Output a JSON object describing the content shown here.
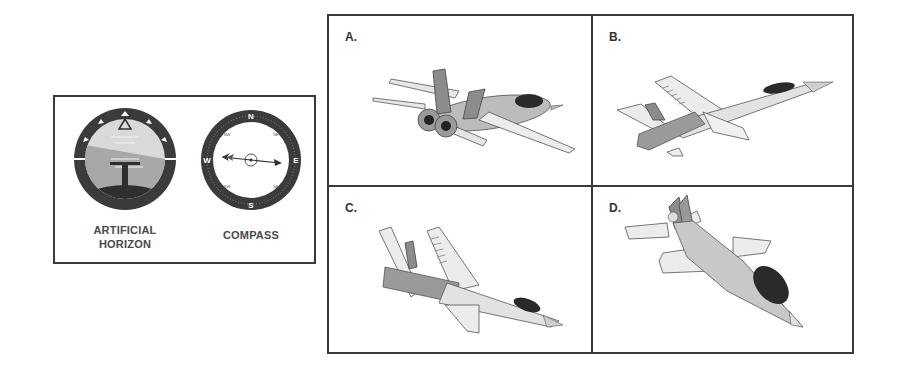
{
  "instruments_panel": {
    "artificial_horizon": {
      "label_line1": "ARTIFICIAL",
      "label_line2": "HORIZON"
    },
    "compass": {
      "label": "COMPASS",
      "cardinals": {
        "n": "N",
        "s": "S",
        "e": "E",
        "w": "W"
      },
      "intercardinals": {
        "nw": "NW",
        "ne": "NE",
        "sw": "SW",
        "se": "SE"
      }
    }
  },
  "options": [
    {
      "label": "A.",
      "description": "Jet viewed from rear, nose pointing right and slightly up, wings banked"
    },
    {
      "label": "B.",
      "description": "Jet climbing to the upper right, viewed from below"
    },
    {
      "label": "C.",
      "description": "Jet diving to the lower right, viewed from below"
    },
    {
      "label": "D.",
      "description": "Jet diving toward the viewer, nose pointing down-right"
    }
  ],
  "colors": {
    "border": "#3a3a3a",
    "dark": "#333333",
    "mid_gray": "#8c8c8c",
    "light_gray": "#c8c8c8",
    "pale": "#e6e6e6",
    "canopy": "#2a2a2a"
  }
}
